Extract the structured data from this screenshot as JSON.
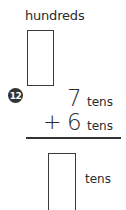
{
  "problem": {
    "number": "12",
    "answer_label_top": "hundreds",
    "addend1": {
      "value": "7",
      "unit": "tens"
    },
    "operator": "+",
    "addend2": {
      "value": "6",
      "unit": "tens"
    },
    "answer_label_bottom": "tens",
    "answer_top_value": "",
    "answer_bottom_value": ""
  }
}
